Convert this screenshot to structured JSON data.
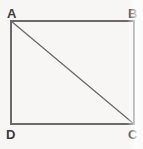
{
  "figure": {
    "kind": "geometry-diagram",
    "background_color": "#f7f6f5",
    "stroke_color": "#6a6a6a",
    "label_color": "#3b3b3b",
    "stroke_width": 1.3,
    "rectangle": {
      "left": 11,
      "top": 21,
      "right": 134,
      "bottom": 124
    },
    "diagonal": {
      "from": "A",
      "to": "C",
      "x1": 11,
      "y1": 21,
      "x2": 134,
      "y2": 124
    },
    "vertices": [
      {
        "id": "A",
        "label": "A",
        "position": "top-left",
        "x": 11,
        "y": 21
      },
      {
        "id": "B",
        "label": "B",
        "position": "top-right",
        "x": 134,
        "y": 21
      },
      {
        "id": "C",
        "label": "C",
        "position": "bottom-right",
        "x": 134,
        "y": 124
      },
      {
        "id": "D",
        "label": "D",
        "position": "bottom-left",
        "x": 11,
        "y": 124
      }
    ]
  }
}
